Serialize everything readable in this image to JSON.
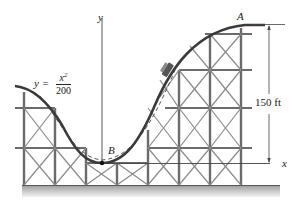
{
  "figure": {
    "type": "roller coaster on trestle structure",
    "equation": {
      "lhs": "y =",
      "numerator_base": "x",
      "numerator_exp": "2",
      "denominator": "200"
    },
    "points": {
      "A": "A",
      "B": "B"
    },
    "axes": {
      "x": "x",
      "y": "y"
    },
    "dimension": {
      "height_label": "150 ft"
    },
    "colors": {
      "track": "#3a3a3a",
      "trestle": "#6b6b6b",
      "ground": "#b5b5b5",
      "text": "#222222"
    }
  }
}
